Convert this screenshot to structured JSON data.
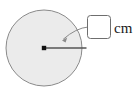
{
  "figure": {
    "type": "geometry-diagram",
    "background_color": "#ffffff"
  },
  "circle": {
    "name": "circle-shape",
    "center_x": 44,
    "center_y": 48,
    "radius": 38,
    "fill_color": "#ebebeb",
    "stroke_color": "#8a8a8a",
    "stroke_width": 1
  },
  "center_point": {
    "name": "center-dot",
    "x": 44,
    "y": 48,
    "size": 4,
    "color": "#111111"
  },
  "radius_line": {
    "name": "radius-segment",
    "x1": 44,
    "y1": 48,
    "x2": 86,
    "y2": 48,
    "color": "#555555",
    "stroke_width": 1.4
  },
  "leader": {
    "name": "leader-arrow",
    "start_x": 88,
    "start_y": 27,
    "control_x": 76,
    "control_y": 28,
    "end_x": 62,
    "end_y": 40,
    "color": "#8a8a8a",
    "stroke_width": 1
  },
  "answer_box": {
    "name": "radius-input-box",
    "x": 87,
    "y": 15,
    "width": 24,
    "height": 24,
    "corner_radius": 3,
    "value": "",
    "placeholder": "",
    "fill_color": "#ffffff",
    "stroke_color": "#6e6e6e"
  },
  "unit": {
    "name": "unit-label",
    "text": "cm",
    "x": 114,
    "y": 33,
    "color": "#1a1a1a"
  }
}
